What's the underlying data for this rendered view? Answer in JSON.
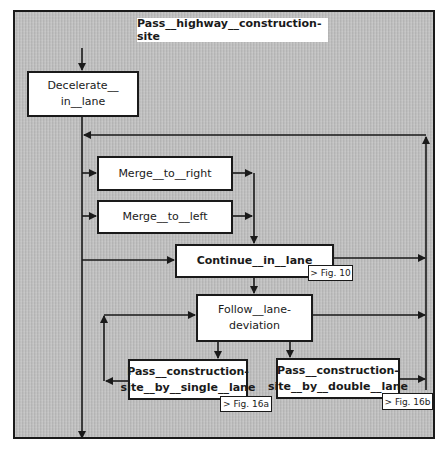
{
  "diagram": {
    "title": "Pass__highway__construction-site",
    "nodes": {
      "decelerate": {
        "label": "Decelerate__\nin__lane"
      },
      "merge_right": {
        "label": "Merge__to__right"
      },
      "merge_left": {
        "label": "Merge__to__left"
      },
      "continue": {
        "label": "Continue__in__lane",
        "ref": "> Fig. 10"
      },
      "follow": {
        "label": "Follow__lane-\ndeviation"
      },
      "single": {
        "label": "Pass__construction-\nsite__by__single__lane",
        "ref": "> Fig. 16a"
      },
      "double": {
        "label": "Pass__construction-\nsite__by__double__lane",
        "ref": "> Fig. 16b"
      }
    },
    "colors": {
      "background": "#bdbdbd",
      "box": "#ffffff",
      "line": "#1a1a1a"
    }
  }
}
